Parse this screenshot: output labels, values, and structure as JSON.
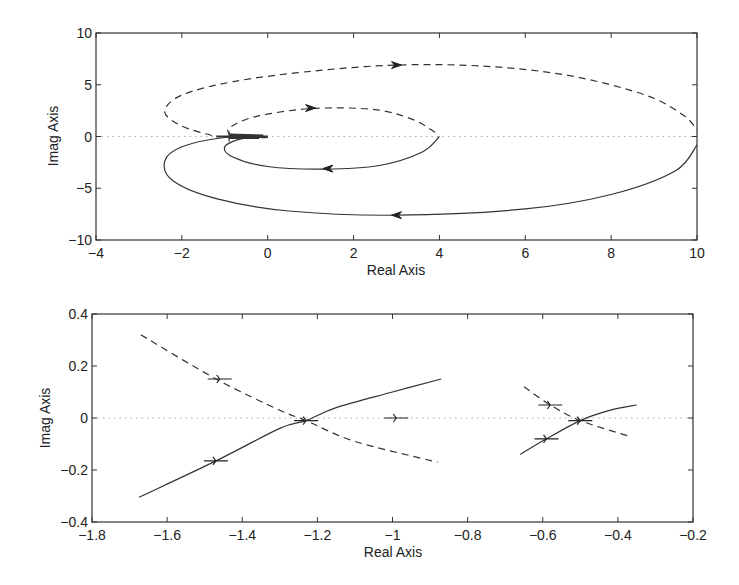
{
  "chart_data": [
    {
      "type": "line",
      "title": "",
      "xlabel": "Real Axis",
      "ylabel": "Imag Axis",
      "xlim": [
        -4,
        10
      ],
      "ylim": [
        -10,
        10
      ],
      "xticks": [
        -4,
        -2,
        0,
        2,
        4,
        6,
        8,
        10
      ],
      "yticks": [
        -10,
        -5,
        0,
        5,
        10
      ],
      "grid": false,
      "zero_line": true,
      "series": [
        {
          "name": "outer-dashed",
          "style": "dashed",
          "points": [
            [
              -1.3,
              0.1
            ],
            [
              -2.0,
              1.0
            ],
            [
              -2.4,
              2.4
            ],
            [
              -2.0,
              4.0
            ],
            [
              -0.8,
              5.3
            ],
            [
              1.0,
              6.3
            ],
            [
              3.0,
              6.9
            ],
            [
              5.0,
              6.8
            ],
            [
              7.0,
              5.9
            ],
            [
              8.8,
              4.0
            ],
            [
              9.7,
              2.0
            ],
            [
              10.0,
              0.6
            ]
          ],
          "arrow": {
            "at": [
              3.0,
              6.9
            ],
            "dir": "right"
          }
        },
        {
          "name": "inner-dashed",
          "style": "dashed",
          "points": [
            [
              -0.85,
              0.1
            ],
            [
              -0.9,
              0.8
            ],
            [
              -0.3,
              1.9
            ],
            [
              1.0,
              2.7
            ],
            [
              2.5,
              2.6
            ],
            [
              3.4,
              1.6
            ],
            [
              3.9,
              0.4
            ]
          ],
          "arrow": {
            "at": [
              1.0,
              2.75
            ],
            "dir": "right"
          }
        },
        {
          "name": "outer-solid",
          "style": "solid",
          "points": [
            [
              10.0,
              -0.8
            ],
            [
              9.5,
              -3.3
            ],
            [
              8.0,
              -5.6
            ],
            [
              6.0,
              -7.0
            ],
            [
              3.0,
              -7.6
            ],
            [
              0.5,
              -7.2
            ],
            [
              -1.2,
              -6.0
            ],
            [
              -2.2,
              -4.3
            ],
            [
              -2.4,
              -2.4
            ],
            [
              -2.0,
              -1.0
            ],
            [
              -1.0,
              -0.1
            ],
            [
              0.0,
              -0.1
            ]
          ],
          "arrow": {
            "at": [
              3.0,
              -7.6
            ],
            "dir": "left"
          }
        },
        {
          "name": "inner-solid",
          "style": "solid",
          "points": [
            [
              4.0,
              0.0
            ],
            [
              3.6,
              -1.5
            ],
            [
              2.6,
              -2.8
            ],
            [
              1.3,
              -3.15
            ],
            [
              0.0,
              -2.9
            ],
            [
              -0.8,
              -2.0
            ],
            [
              -1.0,
              -1.0
            ],
            [
              -0.6,
              -0.2
            ],
            [
              0.0,
              -0.1
            ]
          ],
          "arrow": {
            "at": [
              1.4,
              -3.1
            ],
            "dir": "left"
          }
        }
      ]
    },
    {
      "type": "line",
      "title": "",
      "xlabel": "Real Axis",
      "ylabel": "Imag Axis",
      "xlim": [
        -1.8,
        -0.2
      ],
      "ylim": [
        -0.4,
        0.4
      ],
      "xticks": [
        -1.8,
        -1.6,
        -1.4,
        -1.2,
        -1.0,
        -0.8,
        -0.6,
        -0.4,
        -0.2
      ],
      "xticklabels": [
        "-1.8",
        "-1.6",
        "-1.4",
        "-1.2",
        "-1",
        "-0.8",
        "-0.6",
        "-0.4",
        "-0.2"
      ],
      "yticks": [
        -0.4,
        -0.2,
        0,
        0.2,
        0.4
      ],
      "yticklabels": [
        "-0.4",
        "-0.2",
        "0",
        "0.2",
        "0.4"
      ],
      "grid": false,
      "zero_line": true,
      "series": [
        {
          "name": "left-solid",
          "style": "solid",
          "points": [
            [
              -1.675,
              -0.305
            ],
            [
              -1.47,
              -0.165
            ],
            [
              -1.3,
              -0.04
            ],
            [
              -1.23,
              -0.01
            ],
            [
              -1.15,
              0.04
            ],
            [
              -1.0,
              0.1
            ],
            [
              -0.87,
              0.15
            ]
          ],
          "marks": [
            [
              -1.47,
              -0.165
            ],
            [
              -1.23,
              -0.01
            ]
          ]
        },
        {
          "name": "left-dashed",
          "style": "dashed",
          "points": [
            [
              -1.67,
              0.32
            ],
            [
              -1.47,
              0.15
            ],
            [
              -1.3,
              0.03
            ],
            [
              -1.23,
              -0.01
            ],
            [
              -1.1,
              -0.09
            ],
            [
              -0.88,
              -0.17
            ]
          ],
          "marks": [
            [
              -1.46,
              0.15
            ]
          ]
        },
        {
          "name": "right-solid",
          "style": "solid",
          "points": [
            [
              -0.66,
              -0.14
            ],
            [
              -0.59,
              -0.08
            ],
            [
              -0.5,
              -0.01
            ],
            [
              -0.42,
              0.03
            ],
            [
              -0.35,
              0.05
            ]
          ],
          "marks": [
            [
              -0.59,
              -0.08
            ],
            [
              -0.5,
              -0.01
            ]
          ]
        },
        {
          "name": "right-dashed",
          "style": "dashed",
          "points": [
            [
              -0.65,
              0.12
            ],
            [
              -0.58,
              0.05
            ],
            [
              -0.5,
              -0.01
            ],
            [
              -0.37,
              -0.07
            ]
          ],
          "marks": [
            [
              -0.58,
              0.05
            ]
          ]
        },
        {
          "name": "pole-marker",
          "style": "mark",
          "points": [
            [
              -0.99,
              0.0
            ]
          ],
          "marks": [
            [
              -0.99,
              0.0
            ]
          ]
        }
      ]
    }
  ],
  "panels": [
    {
      "xlabel": "Real Axis",
      "ylabel": "Imag Axis",
      "xticklabels": [
        "-4",
        "-2",
        "0",
        "2",
        "4",
        "6",
        "8",
        "10"
      ],
      "yticklabels": [
        "-10",
        "-5",
        "0",
        "5",
        "10"
      ]
    },
    {
      "xlabel": "Real Axis",
      "ylabel": "Imag Axis",
      "xticklabels": [
        "-1.8",
        "-1.6",
        "-1.4",
        "-1.2",
        "-1",
        "-0.8",
        "-0.6",
        "-0.4",
        "-0.2"
      ],
      "yticklabels": [
        "-0.4",
        "-0.2",
        "0",
        "0.2",
        "0.4"
      ]
    }
  ]
}
